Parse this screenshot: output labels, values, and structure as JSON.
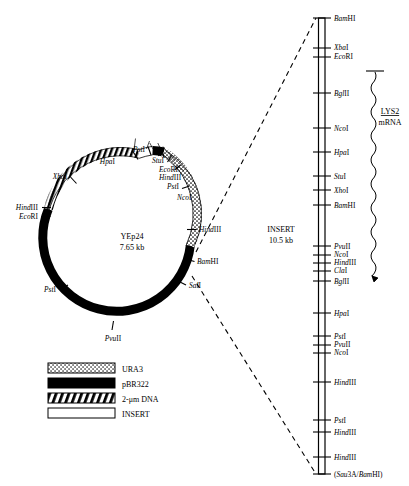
{
  "figure": {
    "plasmid": {
      "name": "YEp24",
      "size": "7.65 kb",
      "sites": [
        {
          "label": "HpaI",
          "italic_part": "Hpa",
          "roman_part": "I"
        },
        {
          "label": "PstI",
          "italic_part": "Pst",
          "roman_part": "I"
        },
        {
          "label": "StuI",
          "italic_part": "Stu",
          "roman_part": "I"
        },
        {
          "label": "EcoRI",
          "italic_part": "Eco",
          "roman_part": "RI"
        },
        {
          "label": "HindIII",
          "italic_part": "Hind",
          "roman_part": "III"
        },
        {
          "label": "PstI",
          "italic_part": "Pst",
          "roman_part": "I"
        },
        {
          "label": "NcoI",
          "italic_part": "Nco",
          "roman_part": "I"
        },
        {
          "label": "HindIII",
          "italic_part": "Hind",
          "roman_part": "III"
        },
        {
          "label": "BamHI",
          "italic_part": "Bam",
          "roman_part": "HI"
        },
        {
          "label": "SalI",
          "italic_part": "Sal",
          "roman_part": "I"
        },
        {
          "label": "PvuII",
          "italic_part": "Pvu",
          "roman_part": "II"
        },
        {
          "label": "PstI",
          "italic_part": "Pst",
          "roman_part": "I"
        },
        {
          "label": "EcoRI",
          "italic_part": "Eco",
          "roman_part": "RI"
        },
        {
          "label": "HindIII",
          "italic_part": "Hind",
          "roman_part": "III"
        },
        {
          "label": "XbaI",
          "italic_part": "Xba",
          "roman_part": "I"
        }
      ]
    },
    "legend": {
      "items": [
        {
          "label": "URA3",
          "pattern": "stipple"
        },
        {
          "label": "pBR322",
          "pattern": "solid"
        },
        {
          "label": "2-μm DNA",
          "pattern": "hatch"
        },
        {
          "label": "INSERT",
          "pattern": "white"
        }
      ]
    },
    "insert": {
      "title": "INSERT",
      "size": "10.5 kb"
    },
    "mrna": {
      "gene": "LYS2",
      "label": "mRNA"
    },
    "linear_map": {
      "sites": [
        {
          "label": "BamHI",
          "italic_part": "Bam",
          "roman_part": "HI",
          "y": 18
        },
        {
          "label": "XbaI",
          "italic_part": "Xba",
          "roman_part": "I",
          "y": 48
        },
        {
          "label": "EcoRI",
          "italic_part": "Eco",
          "roman_part": "RI",
          "y": 57
        },
        {
          "label": "BglII",
          "italic_part": "Bgl",
          "roman_part": "II",
          "y": 93
        },
        {
          "label": "NcoI",
          "italic_part": "Nco",
          "roman_part": "I",
          "y": 128
        },
        {
          "label": "HpaI",
          "italic_part": "Hpa",
          "roman_part": "I",
          "y": 152
        },
        {
          "label": "StuI",
          "italic_part": "Stu",
          "roman_part": "I",
          "y": 176
        },
        {
          "label": "XhoI",
          "italic_part": "Xho",
          "roman_part": "I",
          "y": 190
        },
        {
          "label": "BamHI",
          "italic_part": "Bam",
          "roman_part": "HI",
          "y": 205
        },
        {
          "label": "PvuII",
          "italic_part": "Pvu",
          "roman_part": "II",
          "y": 246
        },
        {
          "label": "NcoI",
          "italic_part": "Nco",
          "roman_part": "I",
          "y": 255
        },
        {
          "label": "HindIII",
          "italic_part": "Hind",
          "roman_part": "III",
          "y": 263
        },
        {
          "label": "ClaI",
          "italic_part": "Cla",
          "roman_part": "I",
          "y": 271
        },
        {
          "label": "BglII",
          "italic_part": "Bgl",
          "roman_part": "II",
          "y": 281
        },
        {
          "label": "HpaI",
          "italic_part": "Hpa",
          "roman_part": "I",
          "y": 313
        },
        {
          "label": "PstI",
          "italic_part": "Pst",
          "roman_part": "I",
          "y": 336
        },
        {
          "label": "PvuII",
          "italic_part": "Pvu",
          "roman_part": "II",
          "y": 345
        },
        {
          "label": "NcoI",
          "italic_part": "Nco",
          "roman_part": "I",
          "y": 353
        },
        {
          "label": "HindIII",
          "italic_part": "Hind",
          "roman_part": "III",
          "y": 382
        },
        {
          "label": "PstI",
          "italic_part": "Pst",
          "roman_part": "I",
          "y": 420
        },
        {
          "label": "HindIII",
          "italic_part": "Hind",
          "roman_part": "III",
          "y": 432
        },
        {
          "label": "HindIII",
          "italic_part": "Hind",
          "roman_part": "III",
          "y": 457
        },
        {
          "label": "(Sau3A/BamHI)",
          "italic_part": "(Sau",
          "roman_part": "3A/",
          "italic_part2": "Bam",
          "roman_part2": "HI)",
          "y": 474
        }
      ]
    }
  }
}
